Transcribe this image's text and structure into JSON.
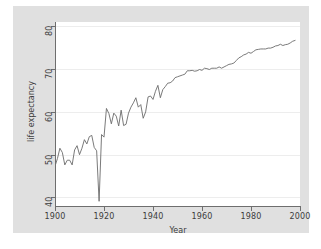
{
  "chart_data": {
    "type": "line",
    "title": "",
    "xlabel": "Year",
    "ylabel": "life expectancy",
    "xlim": [
      1900,
      2000
    ],
    "ylim": [
      38,
      81
    ],
    "xticks": [
      1900,
      1920,
      1940,
      1960,
      1980,
      2000
    ],
    "yticks": [
      40,
      50,
      60,
      70,
      80
    ],
    "xtick_labels": [
      "1900",
      "1920",
      "1940",
      "1960",
      "1980",
      "2000"
    ],
    "ytick_labels": [
      "40",
      "50",
      "60",
      "70",
      "80"
    ],
    "grid": "horizontal",
    "legend": "none",
    "line_color": "#6b6b6b",
    "plot_background": "#ffffff",
    "figure_background": "#e0e0e0",
    "series": [
      {
        "name": "life expectancy",
        "x": [
          1900,
          1901,
          1902,
          1903,
          1904,
          1905,
          1906,
          1907,
          1908,
          1909,
          1910,
          1911,
          1912,
          1913,
          1914,
          1915,
          1916,
          1917,
          1918,
          1919,
          1920,
          1921,
          1922,
          1923,
          1924,
          1925,
          1926,
          1927,
          1928,
          1929,
          1930,
          1931,
          1932,
          1933,
          1934,
          1935,
          1936,
          1937,
          1938,
          1939,
          1940,
          1941,
          1942,
          1943,
          1944,
          1945,
          1946,
          1947,
          1948,
          1949,
          1950,
          1951,
          1952,
          1953,
          1954,
          1955,
          1956,
          1957,
          1958,
          1959,
          1960,
          1961,
          1962,
          1963,
          1964,
          1965,
          1966,
          1967,
          1968,
          1969,
          1970,
          1971,
          1972,
          1973,
          1974,
          1975,
          1976,
          1977,
          1978,
          1979,
          1980,
          1981,
          1982,
          1983,
          1984,
          1985,
          1986,
          1987,
          1988,
          1989,
          1990,
          1991,
          1992,
          1993,
          1994,
          1995,
          1996,
          1997,
          1998
        ],
        "y": [
          47.3,
          49.1,
          51.5,
          50.5,
          47.6,
          48.7,
          48.7,
          47.6,
          51.1,
          52.1,
          50.0,
          51.5,
          53.5,
          52.5,
          54.2,
          54.5,
          51.7,
          50.9,
          39.1,
          54.7,
          54.1,
          60.8,
          59.6,
          57.2,
          59.7,
          59.0,
          56.7,
          60.4,
          56.8,
          57.1,
          59.7,
          61.1,
          62.1,
          63.3,
          61.1,
          61.7,
          58.5,
          60.0,
          63.5,
          63.7,
          62.9,
          64.8,
          66.2,
          63.3,
          65.2,
          65.9,
          66.7,
          66.8,
          67.2,
          68.0,
          68.2,
          68.4,
          68.6,
          68.8,
          69.6,
          69.6,
          69.7,
          69.5,
          69.6,
          69.9,
          69.7,
          70.2,
          70.1,
          69.9,
          70.2,
          70.2,
          70.2,
          70.5,
          70.2,
          70.5,
          70.8,
          71.1,
          71.2,
          71.4,
          72.0,
          72.6,
          72.9,
          73.3,
          73.5,
          73.9,
          73.7,
          74.1,
          74.5,
          74.6,
          74.7,
          74.7,
          74.7,
          74.9,
          74.9,
          75.1,
          75.4,
          75.5,
          75.8,
          75.5,
          75.7,
          75.8,
          76.1,
          76.5,
          76.7
        ]
      }
    ]
  }
}
